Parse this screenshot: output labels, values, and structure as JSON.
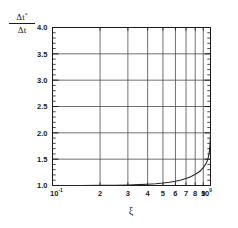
{
  "chart_data": {
    "type": "line",
    "title": "",
    "xlabel": "ξ",
    "ylabel_numerator": "Δt*",
    "ylabel_denominator": "Δt",
    "xscale": "log",
    "yscale": "linear",
    "xlim": [
      0.1,
      1.0
    ],
    "ylim": [
      1.0,
      4.0
    ],
    "grid": true,
    "legend": "none",
    "x_tick_labels": [
      "10",
      "2",
      "3",
      "4",
      "5",
      "6",
      "7",
      "8",
      "9",
      "10"
    ],
    "x_tick_exponents": [
      "-1",
      "",
      "",
      "",
      "",
      "",
      "",
      "",
      "",
      "0"
    ],
    "x_tick_values": [
      0.1,
      0.2,
      0.3,
      0.4,
      0.5,
      0.6,
      0.7,
      0.8,
      0.9,
      1.0
    ],
    "y_tick_labels": [
      "1.0",
      "1.5",
      "2.0",
      "2.5",
      "3.0",
      "3.5",
      "4.0"
    ],
    "y_tick_values": [
      1.0,
      1.5,
      2.0,
      2.5,
      3.0,
      3.5,
      4.0
    ],
    "series": [
      {
        "name": "dt-ratio",
        "color": "#262626",
        "x": [
          0.1,
          0.15,
          0.2,
          0.25,
          0.3,
          0.35,
          0.4,
          0.45,
          0.5,
          0.55,
          0.6,
          0.65,
          0.7,
          0.75,
          0.8,
          0.84,
          0.87,
          0.9,
          0.92,
          0.94,
          0.955,
          0.968,
          0.978,
          0.986,
          0.992,
          0.996,
          0.999,
          1.0
        ],
        "y": [
          1.0,
          1.001,
          1.003,
          1.006,
          1.01,
          1.016,
          1.024,
          1.034,
          1.047,
          1.062,
          1.081,
          1.104,
          1.132,
          1.167,
          1.212,
          1.252,
          1.29,
          1.337,
          1.377,
          1.427,
          1.475,
          1.534,
          1.596,
          1.672,
          1.76,
          1.848,
          1.952,
          2.02
        ]
      }
    ]
  },
  "figure": {
    "background_color": "#ffffff",
    "axis_color": "#1a1a1a",
    "grid_color": "#4d4d4d"
  }
}
